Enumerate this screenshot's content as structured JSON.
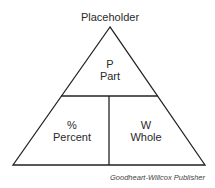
{
  "title": "Placeholder",
  "sections": {
    "top": {
      "symbol": "P",
      "label": "Part"
    },
    "bottom_left": {
      "symbol": "%",
      "label": "Percent"
    },
    "bottom_right": {
      "symbol": "W",
      "label": "Whole"
    }
  },
  "credit": "Goodheart-Willcox Publisher"
}
